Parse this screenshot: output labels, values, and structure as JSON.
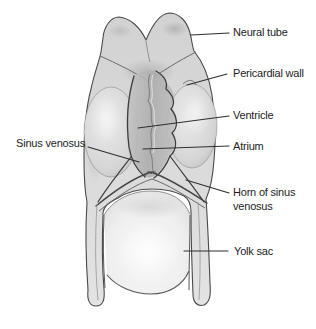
{
  "labels": {
    "neural_tube": "Neural tube",
    "pericardial_wall": "Pericardial wall",
    "ventricle": "Ventricle",
    "atrium": "Atrium",
    "sinus_venosus": "Sinus venosus",
    "horn_of_sinus_venosus": "Horn of sinus venosus",
    "yolk_sac": "Yolk sac"
  },
  "colors": {
    "background": "#ffffff",
    "body_fill": "#d8d8d8",
    "outline": "#4a4a4a",
    "leader_line": "#2f2f2f",
    "label_text": "#1d1d1d"
  }
}
